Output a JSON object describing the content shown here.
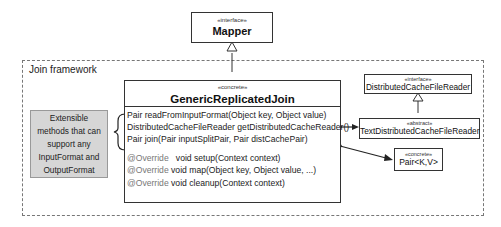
{
  "frame": {
    "label": "Join framework"
  },
  "mapper": {
    "stereotype": "«interface»",
    "name": "Mapper"
  },
  "main_class": {
    "stereotype": "«concrete»",
    "name": "GenericReplicatedJoin",
    "methods": [
      "Pair readFromInputFormat(Object key, Object value)",
      "DistributedCacheFileReader getDistributedCacheReader()",
      "Pair join(Pair inputSplitPair, Pair distCachePair)"
    ],
    "overrides": [
      {
        "annotation": "@Override",
        "signature": "   void setup(Context context)"
      },
      {
        "annotation": "@Override",
        "signature": " void map(Object key, Object value, ...)"
      },
      {
        "annotation": "@Override",
        "signature": " void cleanup(Context context)"
      }
    ]
  },
  "dcfr_interface": {
    "stereotype": "«interface»",
    "name": "DistributedCacheFileReader"
  },
  "text_dcfr": {
    "stereotype": "«abstract»",
    "name": "TextDistributedCacheFileReader"
  },
  "pair": {
    "stereotype": "«concrete»",
    "name": "Pair<K,V>"
  },
  "note": {
    "text_lines": [
      "Extensible",
      "methods that can",
      "support any",
      "InputFormat and",
      "OutputFormat"
    ]
  },
  "colors": {
    "note_fill": "#d6d6d6",
    "frame_border": "#777777",
    "box_border": "#333333"
  }
}
